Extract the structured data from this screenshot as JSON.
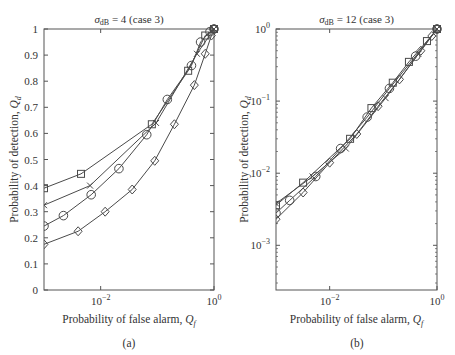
{
  "chart_data": [
    {
      "id": "a",
      "type": "line",
      "panel_label": "(a)",
      "title": "σdB = 4 (case 3)",
      "title_parts": {
        "sigma": "σ",
        "sub": "dB",
        "rest": " = 4 (case 3)"
      },
      "xlabel": "Probability of false alarm, Qf",
      "xlabel_parts": {
        "main": "Probability of false alarm, ",
        "var": "Q",
        "sub": "f"
      },
      "ylabel": "Probability of detection, Qd",
      "ylabel_parts": {
        "main": "Probability of detection, ",
        "var": "Q",
        "sub": "d"
      },
      "xscale": "log",
      "yscale": "linear",
      "xlim": [
        0.001,
        1
      ],
      "ylim": [
        0,
        1
      ],
      "xticks": [
        {
          "value": 0.01,
          "base": "10",
          "exp": "−2"
        },
        {
          "value": 1,
          "base": "10",
          "exp": "0"
        }
      ],
      "yticks": [
        {
          "value": 0,
          "label": "0"
        },
        {
          "value": 0.1,
          "label": "0.1"
        },
        {
          "value": 0.2,
          "label": "0.2"
        },
        {
          "value": 0.3,
          "label": "0.3"
        },
        {
          "value": 0.4,
          "label": "0.4"
        },
        {
          "value": 0.5,
          "label": "0.5"
        },
        {
          "value": 0.6,
          "label": "0.6"
        },
        {
          "value": 0.7,
          "label": "0.7"
        },
        {
          "value": 0.8,
          "label": "0.8"
        },
        {
          "value": 0.9,
          "label": "0.9"
        },
        {
          "value": 1,
          "label": "1"
        }
      ],
      "grid": false,
      "series": [
        {
          "name": "square",
          "marker": "square",
          "x": [
            0.001,
            0.0045,
            0.08,
            0.35,
            0.7,
            1.0
          ],
          "y": [
            0.39,
            0.445,
            0.635,
            0.84,
            0.975,
            1.0
          ]
        },
        {
          "name": "cross",
          "marker": "x",
          "x": [
            0.001,
            0.0065,
            0.095,
            0.5,
            1.0
          ],
          "y": [
            0.325,
            0.4,
            0.64,
            0.905,
            1.0
          ]
        },
        {
          "name": "circle",
          "marker": "circle",
          "x": [
            0.001,
            0.0022,
            0.0068,
            0.021,
            0.065,
            0.15,
            0.4,
            0.58,
            0.85,
            1.0
          ],
          "y": [
            0.245,
            0.285,
            0.365,
            0.465,
            0.595,
            0.73,
            0.86,
            0.95,
            0.99,
            1.0
          ]
        },
        {
          "name": "diamond",
          "marker": "diamond",
          "x": [
            0.001,
            0.004,
            0.012,
            0.036,
            0.09,
            0.2,
            0.45,
            0.7,
            0.9,
            1.0
          ],
          "y": [
            0.175,
            0.225,
            0.3,
            0.385,
            0.495,
            0.635,
            0.785,
            0.905,
            0.975,
            1.0
          ]
        }
      ]
    },
    {
      "id": "b",
      "type": "line",
      "panel_label": "(b)",
      "title": "σdB = 12 (case 3)",
      "title_parts": {
        "sigma": "σ",
        "sub": "dB",
        "rest": " = 12 (case 3)"
      },
      "xlabel": "Probability of false alarm, Qf",
      "xlabel_parts": {
        "main": "Probability of false alarm, ",
        "var": "Q",
        "sub": "f"
      },
      "ylabel": "Probability of detection, Qd",
      "ylabel_parts": {
        "main": "Probability of detection, ",
        "var": "Q",
        "sub": "d"
      },
      "xscale": "log",
      "yscale": "log",
      "xlim": [
        0.001,
        1
      ],
      "ylim": [
        0.00024,
        1
      ],
      "xticks": [
        {
          "value": 0.01,
          "base": "10",
          "exp": "−2"
        },
        {
          "value": 1,
          "base": "10",
          "exp": "0"
        }
      ],
      "yticks": [
        {
          "value": 0.001,
          "base": "10",
          "exp": "−3"
        },
        {
          "value": 0.01,
          "base": "10",
          "exp": "−2"
        },
        {
          "value": 0.1,
          "base": "10",
          "exp": "−1"
        },
        {
          "value": 1,
          "base": "10",
          "exp": "0"
        }
      ],
      "grid": false,
      "series": [
        {
          "name": "square",
          "marker": "square",
          "x": [
            0.001,
            0.0032,
            0.024,
            0.06,
            0.15,
            0.3,
            0.65,
            1.0
          ],
          "y": [
            0.0036,
            0.0074,
            0.03,
            0.08,
            0.18,
            0.35,
            0.68,
            1.0
          ]
        },
        {
          "name": "cross",
          "marker": "x",
          "x": [
            0.001,
            0.0048,
            0.02,
            0.11,
            0.45,
            1.0
          ],
          "y": [
            0.0038,
            0.009,
            0.022,
            0.11,
            0.45,
            1.0
          ]
        },
        {
          "name": "circle",
          "marker": "circle",
          "x": [
            0.001,
            0.0018,
            0.0055,
            0.016,
            0.05,
            0.13,
            0.4,
            1.0
          ],
          "y": [
            0.0028,
            0.0042,
            0.009,
            0.022,
            0.06,
            0.15,
            0.42,
            1.0
          ]
        },
        {
          "name": "diamond",
          "marker": "diamond",
          "x": [
            0.001,
            0.0032,
            0.01,
            0.032,
            0.08,
            0.2,
            0.5,
            0.8,
            1.0
          ],
          "y": [
            0.0023,
            0.0054,
            0.014,
            0.035,
            0.085,
            0.2,
            0.5,
            0.8,
            1.0
          ]
        }
      ]
    }
  ],
  "colors": {
    "line": "#4a4a4a",
    "axis": "#555555",
    "text": "#333333"
  }
}
